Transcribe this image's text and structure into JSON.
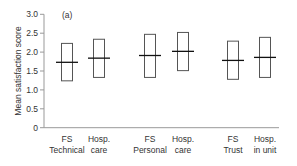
{
  "chart_data": {
    "type": "box",
    "panel_label": "(a)",
    "title": "",
    "xlabel": "",
    "ylabel": "Mean satisfaction score",
    "ylim": [
      0,
      3.0
    ],
    "yticks": [
      "0",
      "0.5",
      "1.0",
      "1.5",
      "2.0",
      "2.5",
      "3.0"
    ],
    "grid": false,
    "categories": [
      [
        "FS",
        "Technical"
      ],
      [
        "Hosp.",
        "care"
      ],
      [
        "FS",
        "Personal"
      ],
      [
        "Hosp.",
        "care"
      ],
      [
        "FS",
        "Trust"
      ],
      [
        "Hosp.",
        "in unit"
      ]
    ],
    "series": [
      {
        "name": "mean",
        "values": [
          1.73,
          1.84,
          1.91,
          2.02,
          1.78,
          1.86
        ]
      },
      {
        "name": "upper",
        "values": [
          2.23,
          2.34,
          2.47,
          2.52,
          2.29,
          2.39
        ]
      },
      {
        "name": "lower",
        "values": [
          1.24,
          1.33,
          1.33,
          1.51,
          1.28,
          1.33
        ]
      }
    ]
  }
}
